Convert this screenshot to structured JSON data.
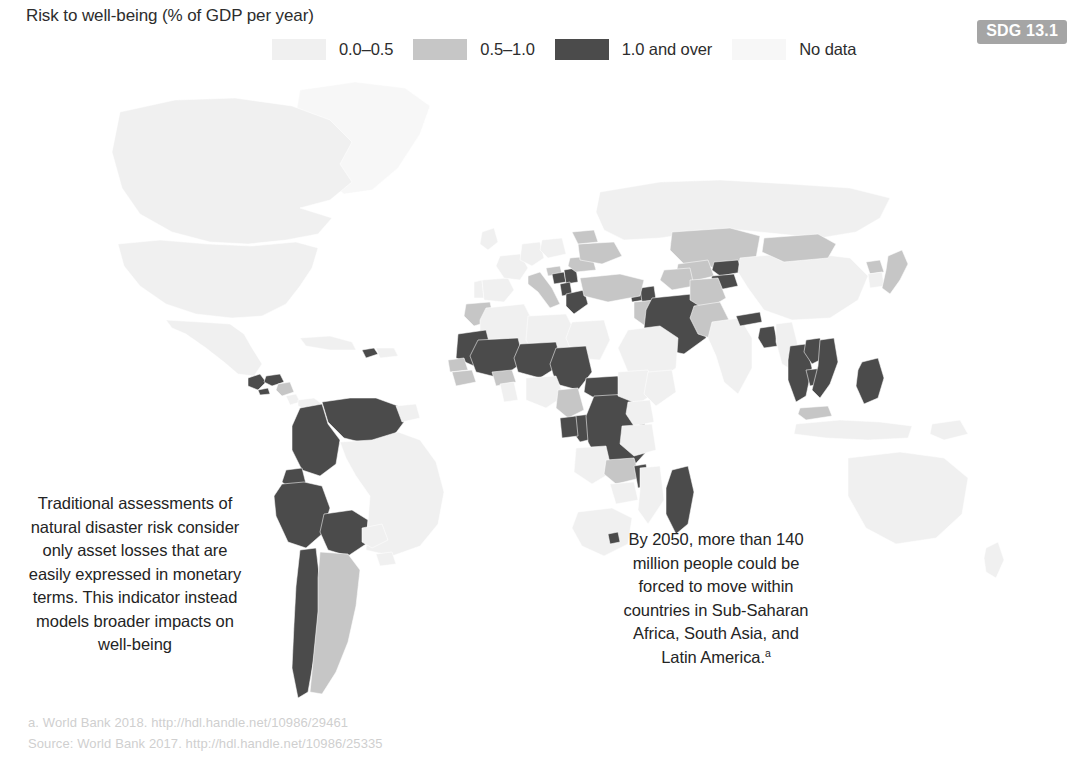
{
  "title": "Risk to well-being (% of GDP per year)",
  "badge": {
    "label": "SDG 13.1"
  },
  "legend": {
    "items": [
      {
        "label": "0.0–0.5",
        "color": "#f0f0f0",
        "key": "low"
      },
      {
        "label": "0.5–1.0",
        "color": "#c6c6c6",
        "key": "mid"
      },
      {
        "label": "1.0 and over",
        "color": "#4b4b4b",
        "key": "high"
      },
      {
        "label": "No data",
        "color": "#f7f7f7",
        "key": "nodata"
      }
    ]
  },
  "annotations": {
    "left": "Traditional assessments of natural disaster risk consider only asset losses that are easily expressed in monetary terms. This indicator instead models broader impacts on well-being",
    "right_text": "By 2050, more than 140 million people could be forced to move within countries in Sub-Saharan Africa, South Asia, and Latin America.",
    "right_superscript": "a"
  },
  "footnotes": [
    "a. World Bank 2018. http://hdl.handle.net/10986/29461",
    "Source: World Bank 2017. http://hdl.handle.net/10986/25335"
  ],
  "chart_data": {
    "type": "map",
    "title": "Risk to well-being (% of GDP per year)",
    "subtitle": "",
    "projection": "world-choropleth",
    "legend_position": "top-center",
    "categories": [
      "0.0–0.5",
      "0.5–1.0",
      "1.0 and over",
      "No data"
    ],
    "category_colors": [
      "#f0f0f0",
      "#c6c6c6",
      "#4b4b4b",
      "#f7f7f7"
    ],
    "regions": [
      {
        "name": "Canada",
        "category": "0.0–0.5"
      },
      {
        "name": "United States",
        "category": "0.0–0.5"
      },
      {
        "name": "Greenland",
        "category": "No data"
      },
      {
        "name": "Mexico",
        "category": "0.0–0.5"
      },
      {
        "name": "Guatemala",
        "category": "1.0 and over"
      },
      {
        "name": "Honduras",
        "category": "1.0 and over"
      },
      {
        "name": "El Salvador",
        "category": "1.0 and over"
      },
      {
        "name": "Nicaragua",
        "category": "0.5–1.0"
      },
      {
        "name": "Costa Rica",
        "category": "0.0–0.5"
      },
      {
        "name": "Panama",
        "category": "0.0–0.5"
      },
      {
        "name": "Cuba",
        "category": "0.0–0.5"
      },
      {
        "name": "Haiti",
        "category": "1.0 and over"
      },
      {
        "name": "Dominican Republic",
        "category": "0.0–0.5"
      },
      {
        "name": "Venezuela",
        "category": "1.0 and over"
      },
      {
        "name": "Colombia",
        "category": "1.0 and over"
      },
      {
        "name": "Ecuador",
        "category": "1.0 and over"
      },
      {
        "name": "Peru",
        "category": "1.0 and over"
      },
      {
        "name": "Bolivia",
        "category": "1.0 and over"
      },
      {
        "name": "Chile",
        "category": "1.0 and over"
      },
      {
        "name": "Argentina",
        "category": "0.5–1.0"
      },
      {
        "name": "Brazil",
        "category": "0.0–0.5"
      },
      {
        "name": "Paraguay",
        "category": "0.0–0.5"
      },
      {
        "name": "Uruguay",
        "category": "0.0–0.5"
      },
      {
        "name": "Guyana",
        "category": "0.0–0.5"
      },
      {
        "name": "Morocco",
        "category": "0.5–1.0"
      },
      {
        "name": "Algeria",
        "category": "0.0–0.5"
      },
      {
        "name": "Libya",
        "category": "0.0–0.5"
      },
      {
        "name": "Egypt",
        "category": "0.0–0.5"
      },
      {
        "name": "Mauritania",
        "category": "1.0 and over"
      },
      {
        "name": "Mali",
        "category": "1.0 and over"
      },
      {
        "name": "Niger",
        "category": "1.0 and over"
      },
      {
        "name": "Chad",
        "category": "1.0 and over"
      },
      {
        "name": "Central African Republic",
        "category": "1.0 and over"
      },
      {
        "name": "Democratic Republic of the Congo",
        "category": "1.0 and over"
      },
      {
        "name": "Republic of the Congo",
        "category": "1.0 and over"
      },
      {
        "name": "Gabon",
        "category": "1.0 and over"
      },
      {
        "name": "Cameroon",
        "category": "0.5–1.0"
      },
      {
        "name": "Nigeria",
        "category": "0.0–0.5"
      },
      {
        "name": "Senegal",
        "category": "0.5–1.0"
      },
      {
        "name": "Guinea",
        "category": "0.5–1.0"
      },
      {
        "name": "Burkina Faso",
        "category": "0.5–1.0"
      },
      {
        "name": "Ghana",
        "category": "0.0–0.5"
      },
      {
        "name": "Ethiopia",
        "category": "0.0–0.5"
      },
      {
        "name": "Somalia",
        "category": "0.0–0.5"
      },
      {
        "name": "Kenya",
        "category": "0.0–0.5"
      },
      {
        "name": "Tanzania",
        "category": "0.0–0.5"
      },
      {
        "name": "Zambia",
        "category": "0.5–1.0"
      },
      {
        "name": "Malawi",
        "category": "1.0 and over"
      },
      {
        "name": "Madagascar",
        "category": "1.0 and over"
      },
      {
        "name": "Mozambique",
        "category": "0.0–0.5"
      },
      {
        "name": "Zimbabwe",
        "category": "0.0–0.5"
      },
      {
        "name": "South Africa",
        "category": "0.0–0.5"
      },
      {
        "name": "Angola",
        "category": "0.0–0.5"
      },
      {
        "name": "Lesotho",
        "category": "1.0 and over"
      },
      {
        "name": "Yemen",
        "category": "0.5–1.0"
      },
      {
        "name": "Saudi Arabia",
        "category": "0.0–0.5"
      },
      {
        "name": "Iran",
        "category": "1.0 and over"
      },
      {
        "name": "Iraq",
        "category": "0.5–1.0"
      },
      {
        "name": "Turkey",
        "category": "0.5–1.0"
      },
      {
        "name": "Greece",
        "category": "1.0 and over"
      },
      {
        "name": "Albania",
        "category": "1.0 and over"
      },
      {
        "name": "Serbia",
        "category": "1.0 and over"
      },
      {
        "name": "Bosnia and Herzegovina",
        "category": "1.0 and over"
      },
      {
        "name": "Croatia",
        "category": "0.5–1.0"
      },
      {
        "name": "Italy",
        "category": "0.5–1.0"
      },
      {
        "name": "Romania",
        "category": "0.5–1.0"
      },
      {
        "name": "Ukraine",
        "category": "0.5–1.0"
      },
      {
        "name": "Belarus",
        "category": "0.5–1.0"
      },
      {
        "name": "Poland",
        "category": "0.0–0.5"
      },
      {
        "name": "Germany",
        "category": "0.0–0.5"
      },
      {
        "name": "France",
        "category": "0.0–0.5"
      },
      {
        "name": "Spain",
        "category": "0.0–0.5"
      },
      {
        "name": "Portugal",
        "category": "0.0–0.5"
      },
      {
        "name": "United Kingdom",
        "category": "0.0–0.5"
      },
      {
        "name": "Russia",
        "category": "0.0–0.5"
      },
      {
        "name": "Georgia",
        "category": "1.0 and over"
      },
      {
        "name": "Armenia",
        "category": "1.0 and over"
      },
      {
        "name": "Azerbaijan",
        "category": "1.0 and over"
      },
      {
        "name": "Kazakhstan",
        "category": "0.5–1.0"
      },
      {
        "name": "Uzbekistan",
        "category": "0.5–1.0"
      },
      {
        "name": "Turkmenistan",
        "category": "0.5–1.0"
      },
      {
        "name": "Kyrgyzstan",
        "category": "1.0 and over"
      },
      {
        "name": "Tajikistan",
        "category": "1.0 and over"
      },
      {
        "name": "Afghanistan",
        "category": "0.5–1.0"
      },
      {
        "name": "Pakistan",
        "category": "0.5–1.0"
      },
      {
        "name": "India",
        "category": "0.0–0.5"
      },
      {
        "name": "Nepal",
        "category": "1.0 and over"
      },
      {
        "name": "Bangladesh",
        "category": "1.0 and over"
      },
      {
        "name": "Myanmar",
        "category": "0.0–0.5"
      },
      {
        "name": "Thailand",
        "category": "1.0 and over"
      },
      {
        "name": "Cambodia",
        "category": "1.0 and over"
      },
      {
        "name": "Laos",
        "category": "1.0 and over"
      },
      {
        "name": "Vietnam",
        "category": "1.0 and over"
      },
      {
        "name": "Malaysia",
        "category": "0.5–1.0"
      },
      {
        "name": "Indonesia",
        "category": "0.0–0.5"
      },
      {
        "name": "Philippines",
        "category": "1.0 and over"
      },
      {
        "name": "China",
        "category": "0.0–0.5"
      },
      {
        "name": "Mongolia",
        "category": "0.5–1.0"
      },
      {
        "name": "Japan",
        "category": "0.5–1.0"
      },
      {
        "name": "South Korea",
        "category": "0.0–0.5"
      },
      {
        "name": "North Korea",
        "category": "0.5–1.0"
      },
      {
        "name": "Australia",
        "category": "0.0–0.5"
      },
      {
        "name": "New Zealand",
        "category": "0.0–0.5"
      },
      {
        "name": "Papua New Guinea",
        "category": "0.0–0.5"
      }
    ]
  }
}
